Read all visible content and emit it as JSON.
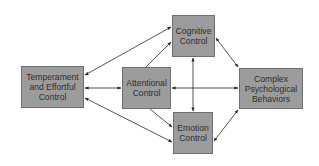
{
  "diagram": {
    "background": "#ffffff",
    "colors": {
      "node_fill": "#9c9c9c",
      "node_border": "#6f6f6f",
      "text": "#2e2e2e",
      "edge": "#2a2a2a"
    },
    "nodes": [
      {
        "id": "temperament",
        "label": "Temperament\nand Effortful\nControl",
        "x": 21,
        "y": 66,
        "w": 63,
        "h": 42
      },
      {
        "id": "attentional",
        "label": "Attentional\nControl",
        "x": 122,
        "y": 67,
        "w": 49,
        "h": 42
      },
      {
        "id": "cognitive",
        "label": "Cognitive\nControl",
        "x": 172,
        "y": 15,
        "w": 43,
        "h": 42
      },
      {
        "id": "emotion",
        "label": "Emotion\nControl",
        "x": 173,
        "y": 112,
        "w": 40,
        "h": 42
      },
      {
        "id": "complex",
        "label": "Complex\nPsychological\nBehaviors",
        "x": 239,
        "y": 68,
        "w": 64,
        "h": 41
      }
    ],
    "edges": [
      {
        "from": "temperament",
        "to": "cognitive",
        "direction": "both"
      },
      {
        "from": "attentional",
        "to": "cognitive",
        "direction": "forward"
      },
      {
        "from": "temperament",
        "to": "attentional",
        "direction": "both"
      },
      {
        "from": "temperament",
        "to": "emotion",
        "direction": "both"
      },
      {
        "from": "attentional",
        "to": "emotion",
        "direction": "forward"
      },
      {
        "from": "cognitive",
        "to": "emotion",
        "direction": "both"
      },
      {
        "from": "attentional",
        "to": "complex",
        "direction": "both"
      },
      {
        "from": "cognitive",
        "to": "complex",
        "direction": "both"
      },
      {
        "from": "emotion",
        "to": "complex",
        "direction": "both"
      }
    ]
  },
  "labels": {
    "temperament": "Temperament\nand Effortful\nControl",
    "attentional": "Attentional\nControl",
    "cognitive": "Cognitive\nControl",
    "emotion": "Emotion\nControl",
    "complex": "Complex\nPsychological\nBehaviors"
  }
}
